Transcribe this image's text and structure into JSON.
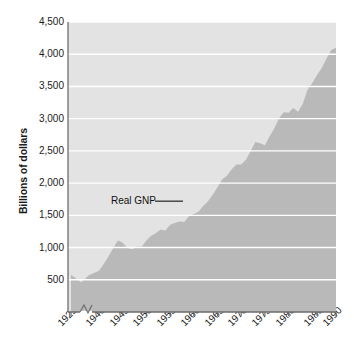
{
  "chart_data": {
    "type": "area",
    "title": "",
    "xlabel": "",
    "ylabel": "Billions of dollars",
    "ylim": [
      0,
      4500
    ],
    "ytick_labels": [
      "4,500",
      "4,000",
      "3,500",
      "3,000",
      "2,500",
      "2,000",
      "1,500",
      "1,000",
      "500"
    ],
    "ytick_values": [
      4500,
      4000,
      3500,
      3000,
      2500,
      2000,
      1500,
      1000,
      500
    ],
    "xtick_labels": [
      "1929",
      "1940",
      "1945",
      "1950",
      "1955",
      "1960",
      "1965",
      "1970",
      "1975",
      "1980",
      "1986",
      "1990"
    ],
    "xtick_values": [
      1929,
      1940,
      1945,
      1950,
      1955,
      1960,
      1965,
      1970,
      1975,
      1980,
      1986,
      1990
    ],
    "axis_break": true,
    "axis_break_between": [
      1929,
      1940
    ],
    "grid": true,
    "grid_color": "#ffffff",
    "plot_background": "#e3e3e3",
    "area_fill_color": "#b9b9b9",
    "legend": "none",
    "annotations": [
      {
        "text": "Real GNP",
        "x": 1962,
        "y": 1720,
        "leader_line": true
      }
    ],
    "series": [
      {
        "name": "Real GNP",
        "x": [
          1929,
          1933,
          1936,
          1940,
          1941,
          1942,
          1943,
          1944,
          1945,
          1946,
          1947,
          1948,
          1949,
          1950,
          1951,
          1952,
          1953,
          1954,
          1955,
          1956,
          1957,
          1958,
          1959,
          1960,
          1961,
          1962,
          1963,
          1964,
          1965,
          1966,
          1967,
          1968,
          1969,
          1970,
          1971,
          1972,
          1973,
          1974,
          1975,
          1976,
          1977,
          1978,
          1979,
          1980,
          1981,
          1982,
          1983,
          1984,
          1985,
          1986,
          1987,
          1988,
          1989,
          1990
        ],
        "y": [
          700,
          560,
          690,
          775,
          900,
          1040,
          1200,
          1340,
          1300,
          1200,
          1180,
          1230,
          1225,
          1340,
          1430,
          1480,
          1550,
          1530,
          1640,
          1670,
          1700,
          1690,
          1800,
          1840,
          1880,
          1990,
          2080,
          2200,
          2340,
          2490,
          2560,
          2680,
          2770,
          2770,
          2860,
          3020,
          3190,
          3170,
          3130,
          3300,
          3450,
          3640,
          3750,
          3740,
          3830,
          3760,
          3910,
          4170,
          4300,
          4450,
          4580,
          4760,
          4920,
          4960
        ],
        "note": "Values rendered in the figure are read off the plotted area from the 0-4,500 axis"
      }
    ]
  },
  "annotation": {
    "real_gnp_label": "Real GNP"
  },
  "axis": {
    "y_title": "Billions of dollars"
  }
}
